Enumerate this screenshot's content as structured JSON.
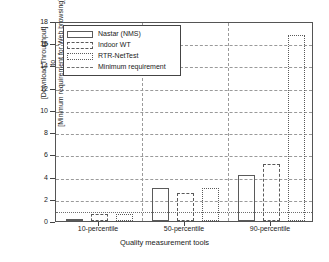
{
  "chart_data": {
    "type": "bar",
    "title": "",
    "subtitle": "",
    "xlabel": "Quality measurement tools",
    "ylabel_lines": [
      "[Download Throughput]",
      "to",
      "[Minimum requirement for Web browsing]"
    ],
    "categories": [
      "10-percentile",
      "50-percentile",
      "90-percentile"
    ],
    "series": [
      {
        "name": "Nastar (NMS)",
        "style": "solid",
        "values": [
          0.15,
          3.0,
          4.1
        ]
      },
      {
        "name": "Indoor WT",
        "style": "dashed",
        "values": [
          0.6,
          2.5,
          5.1
        ]
      },
      {
        "name": "RTR-NetTest",
        "style": "dotted",
        "values": [
          0.6,
          3.0,
          16.7
        ]
      }
    ],
    "reference_line": {
      "name": "Minimum requirement",
      "value": 1,
      "style": "dashed"
    },
    "ylim": [
      0,
      18
    ],
    "yticks": [
      0,
      2,
      4,
      6,
      8,
      10,
      12,
      14,
      16,
      18
    ],
    "ytick_labels": [
      "0",
      "2",
      "4",
      "6",
      "8",
      "10",
      "12",
      "14",
      "16",
      "18"
    ],
    "grid": true,
    "legend_position": "top-left",
    "legend": [
      "Nastar (NMS)",
      "Indoor WT",
      "RTR-NetTest",
      "Minimum requirement"
    ],
    "colors": {
      "axis": "#555555",
      "grid": "#9a9a9a",
      "bar_edge": "#5a5a5a",
      "background": "#ffffff"
    }
  }
}
